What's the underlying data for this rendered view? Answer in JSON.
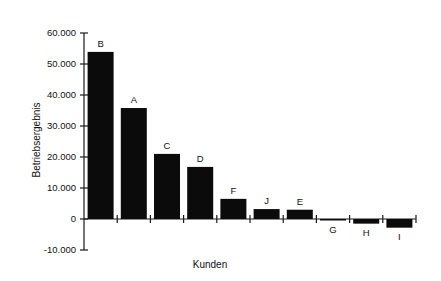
{
  "chart_data": {
    "type": "bar",
    "title": "",
    "xlabel": "Kunden",
    "ylabel": "Betriebsergebnis",
    "categories": [
      "B",
      "A",
      "C",
      "D",
      "F",
      "J",
      "E",
      "G",
      "H",
      "I"
    ],
    "values": [
      53900,
      35800,
      21000,
      16800,
      6500,
      3200,
      3000,
      -300,
      -1500,
      -2800
    ],
    "ylim": [
      -10000,
      60000
    ],
    "ytick_labels": [
      "60.000",
      "50.000",
      "40.000",
      "30.000",
      "20.000",
      "10.000",
      "0",
      "-10.000"
    ],
    "ytick_values": [
      60000,
      50000,
      40000,
      30000,
      20000,
      10000,
      0,
      -10000
    ],
    "grid": false,
    "legend": "none",
    "bar_color": "#0b0b0b",
    "axis_color": "#1a1a1a"
  }
}
